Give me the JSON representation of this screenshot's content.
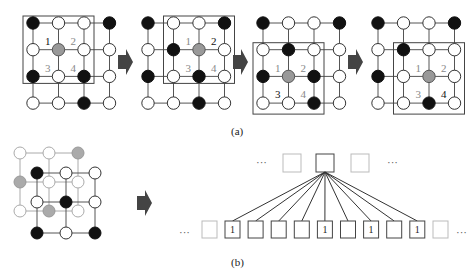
{
  "panel_a": {
    "caption": "(a)",
    "steps": [
      {
        "active_label": "1",
        "labels": [
          "1",
          "2",
          "3",
          "4"
        ],
        "window": {
          "row_start": 0,
          "col_start": 0,
          "size": 3
        },
        "grid": [
          [
            "B",
            "W",
            "W",
            "B"
          ],
          [
            "W",
            "G",
            "W",
            "W"
          ],
          [
            "B",
            "W",
            "B",
            "W"
          ],
          [
            "W",
            "W",
            "B",
            "W"
          ]
        ]
      },
      {
        "active_label": "2",
        "labels": [
          "1",
          "2",
          "3",
          "4"
        ],
        "window": {
          "row_start": 0,
          "col_start": 1,
          "size": 3
        },
        "grid": [
          [
            "B",
            "W",
            "W",
            "B"
          ],
          [
            "W",
            "B",
            "G",
            "W"
          ],
          [
            "B",
            "W",
            "B",
            "W"
          ],
          [
            "W",
            "W",
            "B",
            "W"
          ]
        ]
      },
      {
        "active_label": "3",
        "labels": [
          "1",
          "2",
          "3",
          "4"
        ],
        "window": {
          "row_start": 1,
          "col_start": 0,
          "size": 3
        },
        "grid": [
          [
            "B",
            "W",
            "W",
            "B"
          ],
          [
            "W",
            "B",
            "W",
            "W"
          ],
          [
            "B",
            "G",
            "B",
            "W"
          ],
          [
            "W",
            "W",
            "B",
            "W"
          ]
        ]
      },
      {
        "active_label": "4",
        "labels": [
          "1",
          "2",
          "3",
          "4"
        ],
        "window": {
          "row_start": 1,
          "col_start": 1,
          "size": 3
        },
        "grid": [
          [
            "B",
            "W",
            "W",
            "B"
          ],
          [
            "W",
            "B",
            "W",
            "W"
          ],
          [
            "B",
            "W",
            "G",
            "W"
          ],
          [
            "W",
            "W",
            "B",
            "W"
          ]
        ]
      }
    ]
  },
  "panel_b": {
    "caption": "(b)",
    "back_grid": [
      [
        "W",
        "W",
        "G"
      ],
      [
        "G",
        "W",
        "W"
      ],
      [
        "W",
        "G",
        "W"
      ]
    ],
    "front_grid": [
      [
        "B",
        "W",
        "W"
      ],
      [
        "W",
        "B",
        "W"
      ],
      [
        "B",
        "W",
        "B"
      ]
    ],
    "top_row": {
      "ellipsis_left": "···",
      "ellipsis_right": "···",
      "boxes": [
        "light",
        "dark",
        "light"
      ]
    },
    "bottom_row": {
      "ellipsis_left": "···",
      "ellipsis_right": "···",
      "values": [
        "1",
        "",
        "",
        "",
        "1",
        "",
        "1",
        "",
        "1"
      ]
    }
  },
  "colors": {
    "black_node": "#111111",
    "gray_node": "#999999",
    "arrow": "#444444"
  }
}
